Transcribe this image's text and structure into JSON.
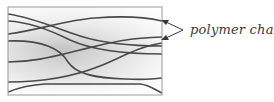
{
  "diagram": {
    "label": "polymer chains",
    "box": {
      "x": 8,
      "y": 7,
      "width": 154,
      "height": 88
    },
    "colors": {
      "border": "#9a9a9a",
      "chain": "#4a4a4a",
      "gradient_center": "#c8c8c8",
      "gradient_edge": "#fbfbfb",
      "arrow": "#3a3a3a",
      "label": "#3a3a3a"
    },
    "chain_count": 8,
    "arrow_count": 2
  }
}
